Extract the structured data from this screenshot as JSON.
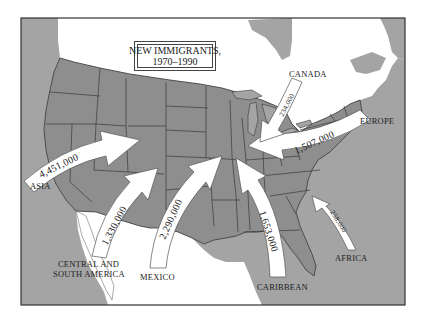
{
  "map": {
    "title_line1": "NEW IMMIGRANTS,",
    "title_line2": "1970–1990",
    "colors": {
      "us_land": "#8f8f8f",
      "ocean": "#a3a3a3",
      "foreign_land": "#ffffff",
      "border": "#3a3a3a",
      "arrow_fill": "#ffffff",
      "arrow_stroke": "#555555"
    },
    "regions": [
      {
        "label": "CANADA"
      },
      {
        "label": "EUROPE"
      },
      {
        "label": "ASIA"
      },
      {
        "label": "CENTRAL AND SOUTH AMERICA",
        "line1": "CENTRAL AND",
        "line2": "SOUTH AMERICA"
      },
      {
        "label": "MEXICO"
      },
      {
        "label": "CARIBBEAN"
      },
      {
        "label": "AFRICA"
      }
    ],
    "flows": [
      {
        "origin": "Asia",
        "value": "4,451,000"
      },
      {
        "origin": "Central and South America",
        "value": "1,330,000"
      },
      {
        "origin": "Mexico",
        "value": "2,290,000"
      },
      {
        "origin": "Caribbean",
        "value": "1,653,000"
      },
      {
        "origin": "Europe",
        "value": "1,507,000"
      },
      {
        "origin": "Canada",
        "value": "234,000"
      },
      {
        "origin": "Africa",
        "value": "258,000"
      }
    ]
  }
}
